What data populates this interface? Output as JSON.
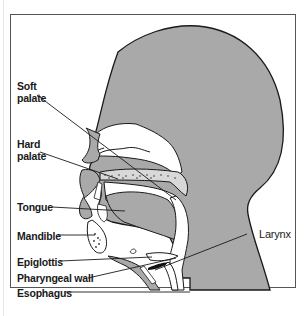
{
  "diagram": {
    "type": "anatomical sagittal section of head and neck",
    "colors": {
      "tissue": "#a9a9a9",
      "outline": "#1a1a1a",
      "background": "#ffffff",
      "frame": "#555555"
    },
    "labels": {
      "soft_palate_1": "Soft",
      "soft_palate_2": "palate",
      "hard_palate_1": "Hard",
      "hard_palate_2": "palate",
      "tongue": "Tongue",
      "mandible": "Mandible",
      "epiglottis": "Epiglottis",
      "pharyngeal_wall": "Pharyngeal wall",
      "esophagus": "Esophagus",
      "larynx": "Larynx"
    }
  }
}
